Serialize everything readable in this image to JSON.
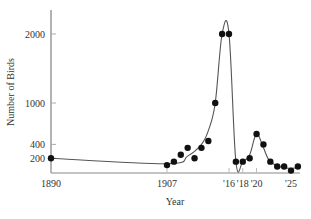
{
  "chart_data": {
    "type": "line",
    "title": "",
    "xlabel": "Year",
    "ylabel": "Number of Birds",
    "x_tick_labels": [
      {
        "year": 1890,
        "label": "1890"
      },
      {
        "year": 1907,
        "label": "1907"
      },
      {
        "year": 1916,
        "label": "'16"
      },
      {
        "year": 1918,
        "label": "'18"
      },
      {
        "year": 1920,
        "label": "'20"
      },
      {
        "year": 1925,
        "label": "'25"
      }
    ],
    "y_ticks": [
      200,
      400,
      1000,
      2000
    ],
    "xlim": [
      1890,
      1926
    ],
    "ylim": [
      0,
      2350
    ],
    "grid": false,
    "legend": null,
    "series": [
      {
        "name": "Observed birds",
        "marker": "filled-circle",
        "points": [
          {
            "x": 1890,
            "y": 200
          },
          {
            "x": 1907,
            "y": 100
          },
          {
            "x": 1908,
            "y": 150
          },
          {
            "x": 1909,
            "y": 250
          },
          {
            "x": 1910,
            "y": 350
          },
          {
            "x": 1911,
            "y": 200
          },
          {
            "x": 1912,
            "y": 350
          },
          {
            "x": 1913,
            "y": 450
          },
          {
            "x": 1914,
            "y": 1000
          },
          {
            "x": 1915,
            "y": 2000
          },
          {
            "x": 1916,
            "y": 2000
          },
          {
            "x": 1917,
            "y": 150
          },
          {
            "x": 1918,
            "y": 150
          },
          {
            "x": 1919,
            "y": 200
          },
          {
            "x": 1920,
            "y": 550
          },
          {
            "x": 1921,
            "y": 400
          },
          {
            "x": 1922,
            "y": 150
          },
          {
            "x": 1923,
            "y": 80
          },
          {
            "x": 1924,
            "y": 80
          },
          {
            "x": 1925,
            "y": 20
          },
          {
            "x": 1926,
            "y": 80
          }
        ]
      },
      {
        "name": "Fitted curve",
        "marker": "none",
        "points": [
          {
            "x": 1890,
            "y": 200
          },
          {
            "x": 1907,
            "y": 120
          },
          {
            "x": 1910,
            "y": 230
          },
          {
            "x": 1912,
            "y": 400
          },
          {
            "x": 1913,
            "y": 600
          },
          {
            "x": 1914,
            "y": 1000
          },
          {
            "x": 1915,
            "y": 2000
          },
          {
            "x": 1916,
            "y": 2000
          },
          {
            "x": 1917,
            "y": 150
          },
          {
            "x": 1918,
            "y": 150
          },
          {
            "x": 1919,
            "y": 250
          },
          {
            "x": 1920,
            "y": 550
          },
          {
            "x": 1921,
            "y": 350
          },
          {
            "x": 1922,
            "y": 150
          },
          {
            "x": 1924,
            "y": 60
          },
          {
            "x": 1926,
            "y": 60
          }
        ]
      }
    ]
  },
  "colors": {
    "axis": "#666666",
    "line": "#555555",
    "marker": "#111111",
    "text": "#333333"
  }
}
